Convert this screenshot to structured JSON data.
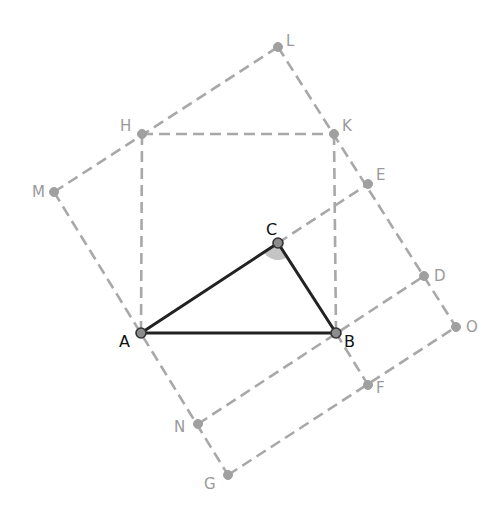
{
  "diagram": {
    "colors": {
      "triangle": "#222222",
      "construction": "#a8a8a8",
      "angle_fill": "#c4c4c4"
    },
    "points": {
      "A": {
        "label": "A",
        "x": 141,
        "y": 333,
        "type": "main"
      },
      "B": {
        "label": "B",
        "x": 336,
        "y": 333,
        "type": "main"
      },
      "C": {
        "label": "C",
        "x": 278,
        "y": 243,
        "type": "main"
      },
      "H": {
        "label": "H",
        "x": 142,
        "y": 134,
        "type": "aux"
      },
      "K": {
        "label": "K",
        "x": 334,
        "y": 134,
        "type": "aux"
      },
      "L": {
        "label": "L",
        "x": 278,
        "y": 47,
        "type": "aux"
      },
      "M": {
        "label": "M",
        "x": 54,
        "y": 192,
        "type": "aux"
      },
      "E": {
        "label": "E",
        "x": 368,
        "y": 184,
        "type": "aux"
      },
      "D": {
        "label": "D",
        "x": 424,
        "y": 276,
        "type": "aux"
      },
      "O": {
        "label": "O",
        "x": 456,
        "y": 327,
        "type": "aux"
      },
      "F": {
        "label": "F",
        "x": 368,
        "y": 385,
        "type": "aux"
      },
      "N": {
        "label": "N",
        "x": 198,
        "y": 424,
        "type": "aux"
      },
      "G": {
        "label": "G",
        "x": 228,
        "y": 475,
        "type": "aux"
      }
    },
    "solid_segments": [
      [
        "A",
        "B"
      ],
      [
        "B",
        "C"
      ],
      [
        "C",
        "A"
      ]
    ],
    "dashed_segments": [
      [
        "H",
        "K"
      ],
      [
        "H",
        "A"
      ],
      [
        "K",
        "B"
      ],
      [
        "M",
        "L"
      ],
      [
        "L",
        "O"
      ],
      [
        "M",
        "G"
      ],
      [
        "G",
        "O"
      ],
      [
        "C",
        "E"
      ],
      [
        "N",
        "D"
      ],
      [
        "B",
        "F"
      ]
    ],
    "angle_marker": {
      "vertex": "C",
      "note": "shaded angle at C"
    }
  }
}
